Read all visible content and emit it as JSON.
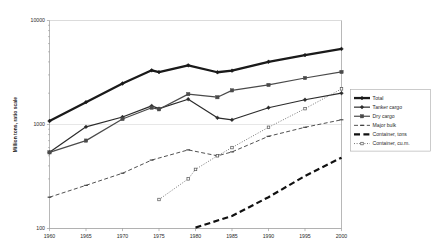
{
  "chart_data": {
    "type": "line",
    "title": "",
    "subtitle": "",
    "xlabel": "",
    "ylabel": "Million tons, ratio scale",
    "yscale": "log",
    "ylim": [
      100,
      10000
    ],
    "ytick_labels": [
      "10000",
      "1000",
      "100"
    ],
    "ytick_values": [
      10000,
      1000,
      100
    ],
    "xlim": [
      1960,
      2000
    ],
    "xtick_labels": [
      "1960",
      "1965",
      "1970",
      "1975",
      "1980",
      "1985",
      "1990",
      "1995",
      "2000"
    ],
    "xtick_values": [
      1960,
      1965,
      1970,
      1975,
      1980,
      1985,
      1990,
      1995,
      2000
    ],
    "grid": true,
    "legend_position": "right",
    "series": [
      {
        "name": "Total",
        "style": "solid-heavy",
        "marker": "diamond",
        "color": "#1a1a1a",
        "x": [
          1960,
          1965,
          1970,
          1974,
          1975,
          1979,
          1983,
          1985,
          1990,
          1995,
          2000
        ],
        "y": [
          1080,
          1640,
          2480,
          3320,
          3190,
          3710,
          3180,
          3290,
          4010,
          4650,
          5330
        ]
      },
      {
        "name": "Tanker cargo",
        "style": "solid",
        "marker": "diamond",
        "color": "#2b2b2b",
        "x": [
          1960,
          1965,
          1970,
          1974,
          1975,
          1979,
          1983,
          1985,
          1990,
          1995,
          2000
        ],
        "y": [
          540,
          950,
          1180,
          1510,
          1420,
          1750,
          1160,
          1110,
          1450,
          1730,
          2000
        ]
      },
      {
        "name": "Dry cargo",
        "style": "solid",
        "marker": "square",
        "color": "#4a4a4a",
        "x": [
          1960,
          1965,
          1970,
          1974,
          1975,
          1979,
          1983,
          1985,
          1990,
          1995,
          2000
        ],
        "y": [
          540,
          700,
          1130,
          1450,
          1400,
          1960,
          1830,
          2130,
          2400,
          2800,
          3200
        ]
      },
      {
        "name": "Major bulk",
        "style": "dashed",
        "marker": "dash",
        "color": "#3d3d3d",
        "x": [
          1960,
          1965,
          1970,
          1974,
          1979,
          1983,
          1985,
          1990,
          1995,
          2000
        ],
        "y": [
          200,
          260,
          340,
          455,
          570,
          500,
          545,
          770,
          940,
          1110
        ]
      },
      {
        "name": "Container, tons",
        "style": "dashed-heavy",
        "marker": "none",
        "color": "#111111",
        "x": [
          1980,
          1985,
          1990,
          1995,
          2000
        ],
        "y": [
          102,
          132,
          200,
          320,
          480
        ]
      },
      {
        "name": "Container, cu.m.",
        "style": "dotted",
        "marker": "square-small",
        "color": "#555555",
        "x": [
          1975,
          1979,
          1980,
          1983,
          1985,
          1990,
          1995,
          2000
        ],
        "y": [
          190,
          300,
          370,
          500,
          600,
          940,
          1420,
          2200
        ]
      }
    ]
  },
  "legend": {
    "items": [
      {
        "label": "Total"
      },
      {
        "label": "Tanker cargo"
      },
      {
        "label": "Dry cargo"
      },
      {
        "label": "Major bulk"
      },
      {
        "label": "Container, tons"
      },
      {
        "label": "Container, cu.m."
      }
    ]
  },
  "icons": {
    "diamond_marker": "diamond-marker-icon",
    "square_marker": "square-marker-icon"
  }
}
